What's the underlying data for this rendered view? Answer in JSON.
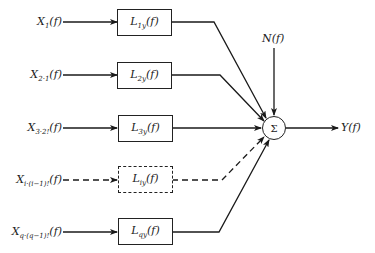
{
  "diagram": {
    "type": "block-diagram",
    "inputs": [
      {
        "base": "X",
        "sub": "1",
        "arg": "(f)",
        "dashed": false
      },
      {
        "base": "X",
        "sub": "2·1",
        "arg": "(f)",
        "dashed": false
      },
      {
        "base": "X",
        "sub": "3·2!",
        "arg": "(f)",
        "dashed": false
      },
      {
        "base": "X",
        "sub": "i·(i−1)!",
        "arg": "(f)",
        "dashed": true
      },
      {
        "base": "X",
        "sub": "q·(q−1)!",
        "arg": "(f)",
        "dashed": false
      }
    ],
    "blocks": [
      {
        "base": "L",
        "sub": "1y",
        "arg": "(f)",
        "dashed": false
      },
      {
        "base": "L",
        "sub": "2y",
        "arg": "(f)",
        "dashed": false
      },
      {
        "base": "L",
        "sub": "3y",
        "arg": "(f)",
        "dashed": false
      },
      {
        "base": "L",
        "sub": "iy",
        "arg": "(f)",
        "dashed": true
      },
      {
        "base": "L",
        "sub": "qy",
        "arg": "(f)",
        "dashed": false
      }
    ],
    "noise": {
      "label": "N(f)"
    },
    "summer": {
      "symbol": "Σ"
    },
    "output": {
      "label": "Y(f)"
    }
  }
}
